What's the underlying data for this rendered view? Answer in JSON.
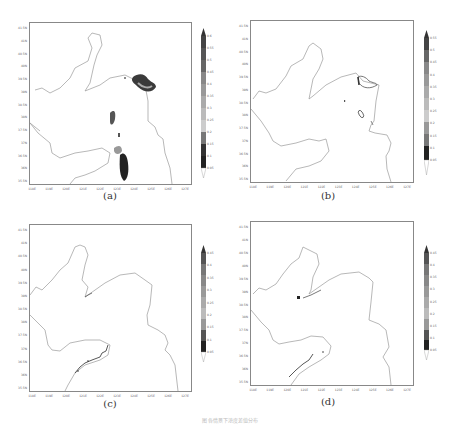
{
  "figure": {
    "caption": "图 各情景下浓度差值分布"
  },
  "chart_data": [
    {
      "type": "heatmap",
      "panel": "(a)",
      "title": "",
      "xlabel": "",
      "ylabel": "",
      "x_ticks": [
        "118E",
        "119E",
        "120E",
        "121E",
        "122E",
        "123E",
        "124E",
        "125E",
        "126E",
        "127E"
      ],
      "y_ticks": [
        "41.5N",
        "41N",
        "40.5N",
        "40N",
        "39.5N",
        "39N",
        "38.5N",
        "38N",
        "37.5N",
        "37N",
        "36.5N",
        "36N",
        "35.5N"
      ],
      "colorbar_levels": [
        0.05,
        0.1,
        0.15,
        0.2,
        0.25,
        0.3,
        0.35,
        0.4,
        0.45,
        0.5,
        0.55,
        0.6
      ],
      "features": [
        "coastline",
        "shaded patches near 123.5E-125E 39.5N",
        "patch near 122.5E 38.8N",
        "patches near 122.5E 36.2N-36.6N"
      ]
    },
    {
      "type": "heatmap",
      "panel": "(b)",
      "x_ticks": [
        "118E",
        "119E",
        "120E",
        "121E",
        "122E",
        "123E",
        "124E",
        "125E",
        "126E",
        "127E"
      ],
      "y_ticks": [
        "41.5N",
        "41N",
        "40.5N",
        "40N",
        "39.5N",
        "39N",
        "38.5N",
        "38N",
        "37.5N",
        "37N",
        "36.5N",
        "36N",
        "35.5N"
      ],
      "colorbar_levels": [
        0.05,
        0.1,
        0.15,
        0.2,
        0.25,
        0.3,
        0.35,
        0.4,
        0.45,
        0.5,
        0.55
      ],
      "features": [
        "coastline",
        "contours near 124E-125E 39.5N",
        "small patch near 123.7E 38.4N"
      ]
    },
    {
      "type": "heatmap",
      "panel": "(c)",
      "x_ticks": [
        "118E",
        "119E",
        "120E",
        "121E",
        "122E",
        "123E",
        "124E",
        "125E",
        "126E",
        "127E"
      ],
      "y_ticks": [
        "41.5N",
        "41N",
        "40.5N",
        "40N",
        "39.5N",
        "39N",
        "38.5N",
        "38N",
        "37.5N",
        "37N",
        "36.5N",
        "36N",
        "35.5N"
      ],
      "colorbar_levels": [
        0.05,
        0.1,
        0.15,
        0.2,
        0.25,
        0.3,
        0.35,
        0.4,
        0.45
      ],
      "features": [
        "coastline",
        "thin values along southern coast 120E-122E"
      ]
    },
    {
      "type": "heatmap",
      "panel": "(d)",
      "x_ticks": [
        "118E",
        "119E",
        "120E",
        "121E",
        "122E",
        "123E",
        "124E",
        "125E",
        "126E",
        "127E"
      ],
      "y_ticks": [
        "41.5N",
        "41N",
        "40.5N",
        "40N",
        "39.5N",
        "39N",
        "38.5N",
        "38N",
        "37.5N",
        "37N",
        "36.5N",
        "36N",
        "35.5N"
      ],
      "colorbar_levels": [
        0.05,
        0.1,
        0.15,
        0.2,
        0.25,
        0.3,
        0.35,
        0.4,
        0.45
      ],
      "features": [
        "coastline",
        "spot near 120.8E 39N",
        "thin values along southern coast"
      ]
    }
  ],
  "panels": [
    {
      "label": "(a)"
    },
    {
      "label": "(b)"
    },
    {
      "label": "(c)"
    },
    {
      "label": "(d)"
    }
  ],
  "colors": {
    "coast": "#9a9a9a",
    "dark": "#2a2a2a",
    "mid": "#777777",
    "light": "#bdbdbd"
  }
}
